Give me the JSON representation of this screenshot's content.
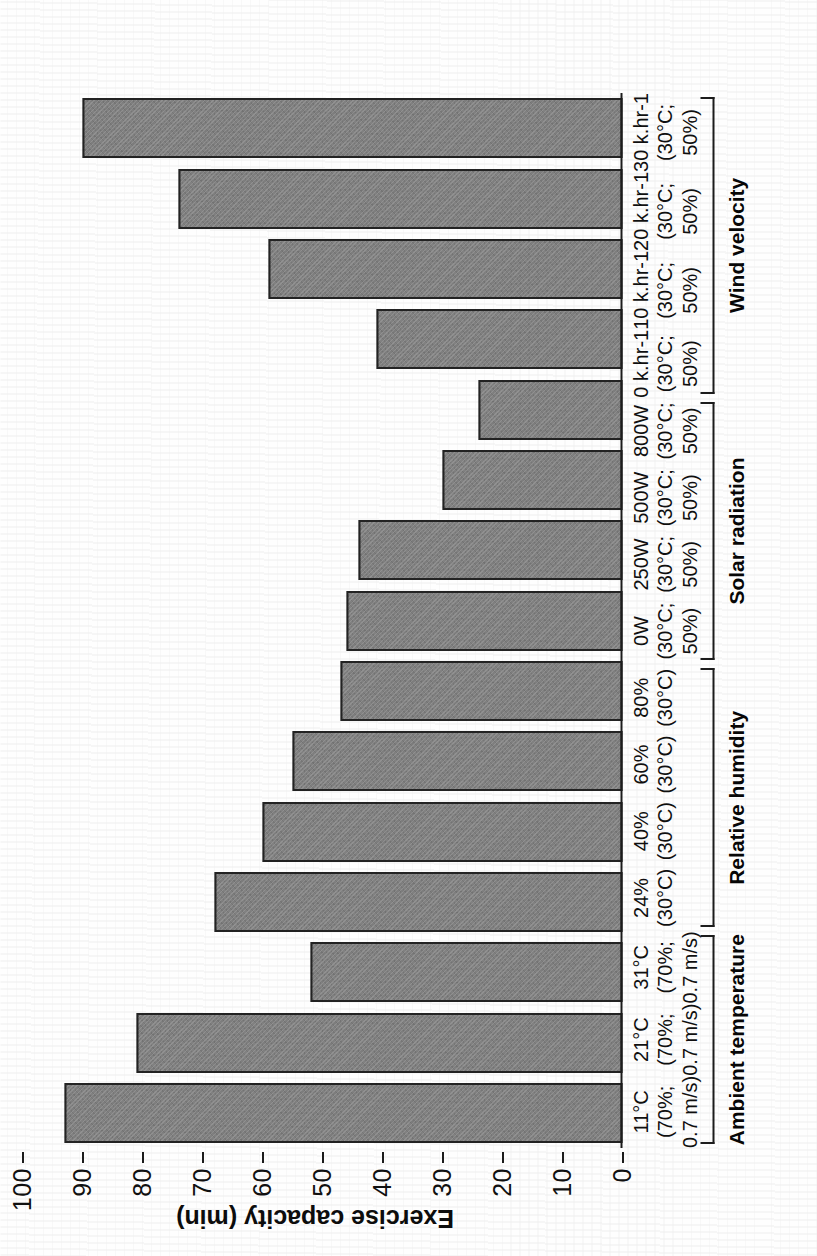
{
  "figure": {
    "background": "#ffffff",
    "bar_fill": "#818181",
    "bar_stroke": "#232323",
    "axis_color": "#1c1c1c"
  },
  "chart_data": {
    "type": "bar",
    "orientation": "vertical-rendered-rotated",
    "title": "",
    "xlabel": "",
    "ylabel": "Exercise capacity (min)",
    "ylim": [
      0,
      100
    ],
    "yticks": [
      0,
      10,
      20,
      30,
      40,
      50,
      60,
      70,
      80,
      90,
      100
    ],
    "ytick_labels": [
      "0",
      "10",
      "20",
      "30",
      "40",
      "50",
      "60",
      "70",
      "80",
      "90",
      "100"
    ],
    "grid": false,
    "legend": "none",
    "categories": [
      "11°C (70%; 0.7 m/s)",
      "21°C (70%; 0.7 m/s)",
      "31°C (70%; 0.7 m/s)",
      "24% (30°C)",
      "40% (30°C)",
      "60% (30°C)",
      "80% (30°C)",
      "0W (30°C; 50%)",
      "250W (30°C; 50%)",
      "500W (30°C; 50%)",
      "800W (30°C; 50%)",
      "0 k.hr-1 (30°C; 50%)",
      "10 k.hr-1 (30°C; 50%)",
      "20 k.hr-1 (30°C; 50%)",
      "30 k.hr-1 (30°C; 50%)"
    ],
    "values": [
      93,
      81,
      52,
      68,
      60,
      55,
      47,
      46,
      44,
      30,
      24,
      41,
      59,
      74,
      90
    ],
    "groups": [
      {
        "title": "Ambient temperature",
        "bars": [
          {
            "label_lines": [
              "11°C",
              "(70%;",
              "0.7 m/s)"
            ],
            "value": 93
          },
          {
            "label_lines": [
              "21°C",
              "(70%;",
              "0.7 m/s)"
            ],
            "value": 81
          },
          {
            "label_lines": [
              "31°C",
              "(70%;",
              "0.7 m/s)"
            ],
            "value": 52
          }
        ]
      },
      {
        "title": "Relative humidity",
        "bars": [
          {
            "label_lines": [
              "24%",
              "(30°C)"
            ],
            "value": 68
          },
          {
            "label_lines": [
              "40%",
              "(30°C)"
            ],
            "value": 60
          },
          {
            "label_lines": [
              "60%",
              "(30°C)"
            ],
            "value": 55
          },
          {
            "label_lines": [
              "80%",
              "(30°C)"
            ],
            "value": 47
          }
        ]
      },
      {
        "title": "Solar radiation",
        "bars": [
          {
            "label_lines": [
              "0W",
              "(30°C;",
              "50%)"
            ],
            "value": 46
          },
          {
            "label_lines": [
              "250W",
              "(30°C;",
              "50%)"
            ],
            "value": 44
          },
          {
            "label_lines": [
              "500W",
              "(30°C;",
              "50%)"
            ],
            "value": 30
          },
          {
            "label_lines": [
              "800W",
              "(30°C;",
              "50%)"
            ],
            "value": 24
          }
        ]
      },
      {
        "title": "Wind velocity",
        "bars": [
          {
            "label_lines": [
              "0 k.hr-1",
              "(30°C;",
              "50%)"
            ],
            "value": 41
          },
          {
            "label_lines": [
              "10 k.hr-1",
              "(30°C;",
              "50%)"
            ],
            "value": 59
          },
          {
            "label_lines": [
              "20 k.hr-1",
              "(30°C;",
              "50%)"
            ],
            "value": 74
          },
          {
            "label_lines": [
              "30 k.hr-1",
              "(30°C;",
              "50%)"
            ],
            "value": 90
          }
        ]
      }
    ]
  }
}
